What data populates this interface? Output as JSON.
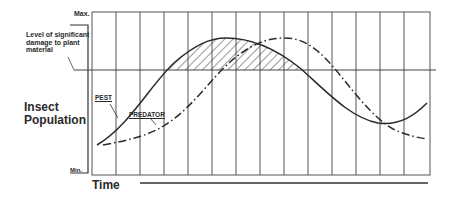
{
  "diagram": {
    "y_axis": {
      "label": "Insect Population",
      "max_label": "Max.",
      "min_label": "Min."
    },
    "x_axis": {
      "label": "Time"
    },
    "threshold": {
      "label": "Level of significant damage to plant material"
    },
    "series": [
      {
        "name": "PEST",
        "style": "solid",
        "color": "#2a2a2a"
      },
      {
        "name": "PREDATOR",
        "style": "dash-dot",
        "color": "#2a2a2a"
      }
    ],
    "hatched_region": "Pest population above damage threshold",
    "grid_columns": 14
  }
}
